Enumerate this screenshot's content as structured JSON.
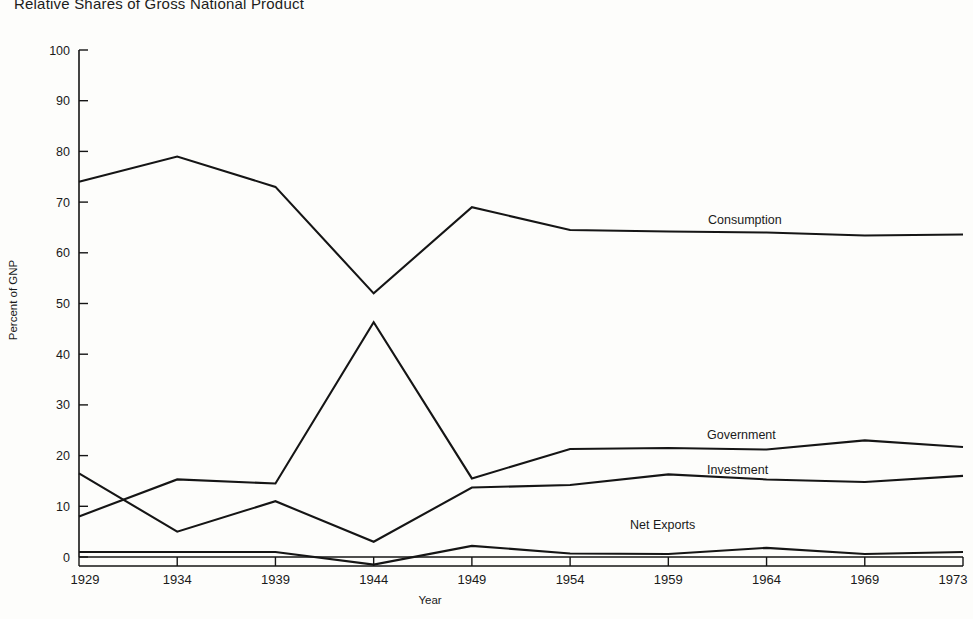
{
  "chart_data": {
    "type": "line",
    "title": "Relative Shares of Gross National Product",
    "xlabel": "Year",
    "ylabel": "Percent of GNP",
    "x": [
      1929,
      1934,
      1939,
      1944,
      1949,
      1954,
      1959,
      1964,
      1969,
      1973
    ],
    "xtick_labels": [
      "1929",
      "1934",
      "1939",
      "1944",
      "1949",
      "1954",
      "1959",
      "1964",
      "1969",
      "1973"
    ],
    "ytick_labels": [
      "0",
      "10",
      "20",
      "30",
      "40",
      "50",
      "60",
      "70",
      "80",
      "90",
      "100"
    ],
    "yticks": [
      0,
      10,
      20,
      30,
      40,
      50,
      60,
      70,
      80,
      90,
      100
    ],
    "ylim": [
      -2,
      100
    ],
    "xlim": [
      1929,
      1973
    ],
    "grid": false,
    "legend_position": "inline-annotations",
    "line_color": "#151515",
    "background_color": "#fdfdfb",
    "series": [
      {
        "name": "Consumption",
        "values": [
          74,
          79,
          73,
          52,
          69,
          64.5,
          64.2,
          64,
          63.4,
          63.6
        ],
        "label_x": 1957,
        "label_y": 69
      },
      {
        "name": "Government",
        "values": [
          8,
          15.3,
          14.5,
          46.3,
          15.5,
          21.3,
          21.5,
          21.2,
          23,
          21.7
        ],
        "label_x": 1955,
        "label_y": 25.5
      },
      {
        "name": "Investment",
        "values": [
          16.5,
          5,
          11,
          3,
          13.7,
          14.2,
          16.3,
          15.3,
          14.8,
          16
        ],
        "label_x": 1955,
        "label_y": 18.7
      },
      {
        "name": "Net Exports",
        "values": [
          1,
          1,
          1,
          -1.5,
          2.2,
          0.7,
          0.6,
          1.8,
          0.6,
          1
        ]
      }
    ],
    "annotations": [
      {
        "text": "Consumption"
      },
      {
        "text": "Government"
      },
      {
        "text": "Investment"
      },
      {
        "text": "Net Exports"
      }
    ]
  }
}
